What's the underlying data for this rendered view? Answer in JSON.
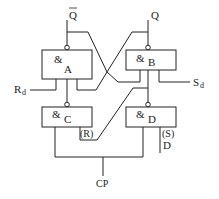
{
  "diagram": {
    "type": "logic-circuit",
    "title": "",
    "gates": [
      {
        "id": "A",
        "symbol": "&",
        "label": "A"
      },
      {
        "id": "B",
        "symbol": "&",
        "label": "B"
      },
      {
        "id": "C",
        "symbol": "&",
        "label": "C"
      },
      {
        "id": "D",
        "symbol": "&",
        "label": "D"
      }
    ],
    "labels": {
      "q_bar": "Q",
      "q": "Q",
      "rd": "R",
      "rd_sub": "d",
      "sd": "S",
      "sd_sub": "d",
      "r_paren": "(R)",
      "s_paren": "(S)",
      "d_input": "D",
      "cp": "CP"
    },
    "colors": {
      "line": "#222222",
      "background": "#ffffff"
    }
  }
}
